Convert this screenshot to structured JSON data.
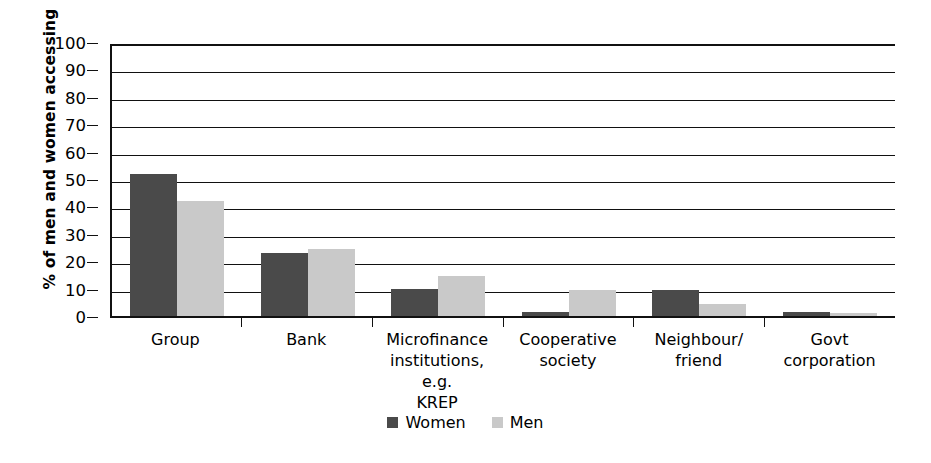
{
  "chart_data": {
    "type": "bar",
    "title": "",
    "xlabel": "",
    "ylabel": "% of men and women accessing",
    "ylim": [
      0,
      100
    ],
    "ytick_step": 10,
    "yticks": [
      100,
      90,
      80,
      70,
      60,
      50,
      40,
      30,
      20,
      10,
      0
    ],
    "grid": true,
    "legend_position": "bottom-center",
    "categories": [
      "Group",
      "Bank",
      "Microfinance institutions, e.g. KREP",
      "Cooperative society",
      "Neighbour/ friend",
      "Govt corporation"
    ],
    "category_lines": [
      [
        "Group"
      ],
      [
        "Bank"
      ],
      [
        "Microfinance",
        "institutions, e.g.",
        "KREP"
      ],
      [
        "Cooperative",
        "society"
      ],
      [
        "Neighbour/",
        "friend"
      ],
      [
        "Govt",
        "corporation"
      ]
    ],
    "series": [
      {
        "name": "Women",
        "color": "#4a4a4a",
        "values": [
          52,
          23,
          10,
          1.5,
          9.5,
          1.5
        ]
      },
      {
        "name": "Men",
        "color": "#c9c9c9",
        "values": [
          42,
          24.5,
          14.5,
          9.5,
          4.5,
          1
        ]
      }
    ]
  },
  "legend": {
    "items": [
      {
        "label": "Women",
        "color": "#4a4a4a"
      },
      {
        "label": "Men",
        "color": "#c9c9c9"
      }
    ]
  },
  "colors": {
    "women": "#4a4a4a",
    "men": "#c9c9c9",
    "axis": "#111111",
    "background": "#ffffff"
  }
}
